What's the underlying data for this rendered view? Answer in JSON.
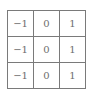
{
  "kernel": {
    "rows": [
      [
        "−1",
        "0",
        "1"
      ],
      [
        "−1",
        "0",
        "1"
      ],
      [
        "−1",
        "0",
        "1"
      ]
    ]
  }
}
